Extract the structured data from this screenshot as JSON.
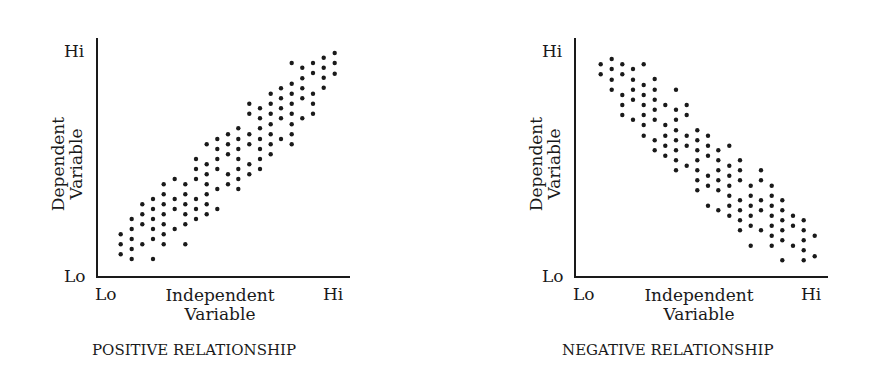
{
  "chart_data": [
    {
      "type": "scatter",
      "title": "POSITIVE RELATIONSHIP",
      "xlabel": "Independent Variable",
      "ylabel": "Dependent Variable",
      "x_ticks": [
        "Lo",
        "Hi"
      ],
      "y_ticks": [
        "Lo",
        "Hi"
      ],
      "grid": false,
      "trend": "positive",
      "axis_px": {
        "x0": 97,
        "y0": 277,
        "x1": 350,
        "ytop": 38
      },
      "zoom_origin": [
        100,
        40
      ],
      "columns": [
        {
          "zx": 62,
          "zy": [
            583,
            613,
            643
          ]
        },
        {
          "zx": 95,
          "zy": [
            537,
            567,
            597,
            627,
            657
          ]
        },
        {
          "zx": 127,
          "zy": [
            493,
            523,
            553,
            613
          ]
        },
        {
          "zx": 159,
          "zy": [
            477,
            507,
            537,
            567,
            597,
            657
          ]
        },
        {
          "zx": 191,
          "zy": [
            433,
            463,
            493,
            523,
            553,
            583,
            613
          ]
        },
        {
          "zx": 224,
          "zy": [
            417,
            477,
            507,
            567
          ]
        },
        {
          "zx": 256,
          "zy": [
            433,
            463,
            493,
            523,
            553,
            613
          ]
        },
        {
          "zx": 288,
          "zy": [
            357,
            387,
            417,
            477,
            507,
            537
          ]
        },
        {
          "zx": 320,
          "zy": [
            313,
            373,
            403,
            433,
            463,
            493,
            523
          ]
        },
        {
          "zx": 352,
          "zy": [
            297,
            327,
            357,
            387,
            447,
            507
          ]
        },
        {
          "zx": 384,
          "zy": [
            283,
            313,
            343,
            403,
            433
          ]
        },
        {
          "zx": 415,
          "zy": [
            265,
            297,
            327,
            357,
            387,
            417,
            447
          ]
        },
        {
          "zx": 448,
          "zy": [
            191,
            221,
            283,
            313,
            373,
            403
          ]
        },
        {
          "zx": 480,
          "zy": [
            205,
            235,
            265,
            297,
            327,
            357,
            387
          ]
        },
        {
          "zx": 512,
          "zy": [
            161,
            191,
            221,
            253,
            283,
            313,
            343
          ]
        },
        {
          "zx": 543,
          "zy": [
            145,
            175,
            205,
            235,
            297
          ]
        },
        {
          "zx": 575,
          "zy": [
            69,
            131,
            161,
            191,
            221,
            253,
            283,
            313
          ]
        },
        {
          "zx": 607,
          "zy": [
            83,
            115,
            145,
            175,
            235
          ]
        },
        {
          "zx": 639,
          "zy": [
            69,
            99,
            161,
            191,
            221
          ]
        },
        {
          "zx": 671,
          "zy": [
            53,
            83,
            113,
            143
          ]
        },
        {
          "zx": 704,
          "zy": [
            39,
            69,
            101
          ]
        }
      ]
    },
    {
      "type": "scatter",
      "title": "NEGATIVE RELATIONSHIP",
      "xlabel": "Independent Variable",
      "ylabel": "Dependent Variable",
      "x_ticks": [
        "Lo",
        "Hi"
      ],
      "y_ticks": [
        "Lo",
        "Hi"
      ],
      "grid": false,
      "trend": "negative",
      "axis_px": {
        "x0": 575,
        "y0": 277,
        "x1": 828,
        "ytop": 38
      },
      "zoom_origin": [
        580,
        40
      ],
      "columns": [
        {
          "zx": 62,
          "zy": [
            73,
            103
          ]
        },
        {
          "zx": 95,
          "zy": [
            57,
            87,
            119,
            149
          ]
        },
        {
          "zx": 127,
          "zy": [
            73,
            103,
            165,
            195,
            225
          ]
        },
        {
          "zx": 159,
          "zy": [
            87,
            119,
            149,
            179,
            239
          ]
        },
        {
          "zx": 191,
          "zy": [
            73,
            135,
            165,
            195,
            225,
            255,
            287
          ]
        },
        {
          "zx": 224,
          "zy": [
            117,
            149,
            179,
            209,
            239,
            301,
            331
          ]
        },
        {
          "zx": 256,
          "zy": [
            195,
            255,
            287,
            317,
            347
          ]
        },
        {
          "zx": 288,
          "zy": [
            149,
            209,
            239,
            271,
            301,
            331,
            361,
            391
          ]
        },
        {
          "zx": 320,
          "zy": [
            195,
            225,
            287,
            317,
            377
          ]
        },
        {
          "zx": 352,
          "zy": [
            271,
            301,
            331,
            361,
            391,
            421,
            451
          ]
        },
        {
          "zx": 384,
          "zy": [
            287,
            317,
            347,
            407,
            437,
            497
          ]
        },
        {
          "zx": 415,
          "zy": [
            331,
            361,
            391,
            421,
            451,
            511
          ]
        },
        {
          "zx": 448,
          "zy": [
            317,
            377,
            407,
            437,
            467,
            497,
            527
          ]
        },
        {
          "zx": 480,
          "zy": [
            361,
            391,
            421,
            481,
            511,
            541,
            571
          ]
        },
        {
          "zx": 512,
          "zy": [
            437,
            467,
            497,
            527,
            557,
            617
          ]
        },
        {
          "zx": 543,
          "zy": [
            391,
            421,
            481,
            511,
            571
          ]
        },
        {
          "zx": 575,
          "zy": [
            437,
            467,
            497,
            527,
            557,
            587,
            617
          ]
        },
        {
          "zx": 607,
          "zy": [
            481,
            511,
            541,
            571,
            601,
            661
          ]
        },
        {
          "zx": 639,
          "zy": [
            527,
            557,
            617
          ]
        },
        {
          "zx": 671,
          "zy": [
            541,
            571,
            601,
            631,
            661
          ]
        },
        {
          "zx": 704,
          "zy": [
            587,
            649
          ]
        }
      ]
    }
  ],
  "left": {
    "y_hi": "Hi",
    "y_lo": "Lo",
    "ylabel_line1": "Dependent",
    "ylabel_line2": "Variable",
    "x_lo": "Lo",
    "x_hi": "Hi",
    "xlabel_line1": "Independent",
    "xlabel_line2": "Variable",
    "caption": "POSITIVE RELATIONSHIP"
  },
  "right": {
    "y_hi": "Hi",
    "y_lo": "Lo",
    "ylabel_line1": "Dependent",
    "ylabel_line2": "Variable",
    "x_lo": "Lo",
    "x_hi": "Hi",
    "xlabel_line1": "Independent",
    "xlabel_line2": "Variable",
    "caption": "NEGATIVE RELATIONSHIP"
  },
  "colors": {
    "ink": "#1a1a1a",
    "background": "#ffffff"
  }
}
